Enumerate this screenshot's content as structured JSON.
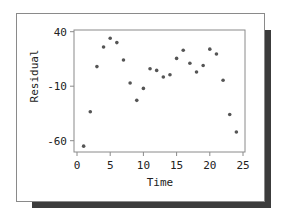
{
  "chart_data": {
    "type": "scatter",
    "title": "",
    "xlabel": "Time",
    "ylabel": "Residual",
    "xlim": [
      0,
      25
    ],
    "ylim": [
      -60,
      40
    ],
    "xticks": [
      0,
      5,
      10,
      15,
      20,
      25
    ],
    "yticks": [
      40,
      -10,
      -60
    ],
    "grid": false,
    "legend": null,
    "x": [
      1,
      2,
      3,
      4,
      5,
      6,
      7,
      8,
      9,
      10,
      11,
      12,
      13,
      14,
      15,
      16,
      17,
      18,
      19,
      20,
      21,
      22,
      23,
      24
    ],
    "y": [
      -65,
      -33.5,
      8,
      26,
      34,
      30,
      14,
      -7,
      -23,
      -12,
      6,
      4.5,
      -1.5,
      0.5,
      15.5,
      23,
      11,
      3,
      9,
      24,
      19.5,
      -4.5,
      -36,
      -52
    ]
  },
  "labels": {
    "xlabel": "Time",
    "ylabel": "Residual",
    "xtick_labels": [
      "0",
      "5",
      "10",
      "15",
      "20",
      "25"
    ],
    "ytick_labels": [
      "40",
      "-10",
      "-60"
    ]
  },
  "colors": {
    "point": "#555555",
    "shadow": "#3c3c3c",
    "frame": "#8a8a8a"
  }
}
